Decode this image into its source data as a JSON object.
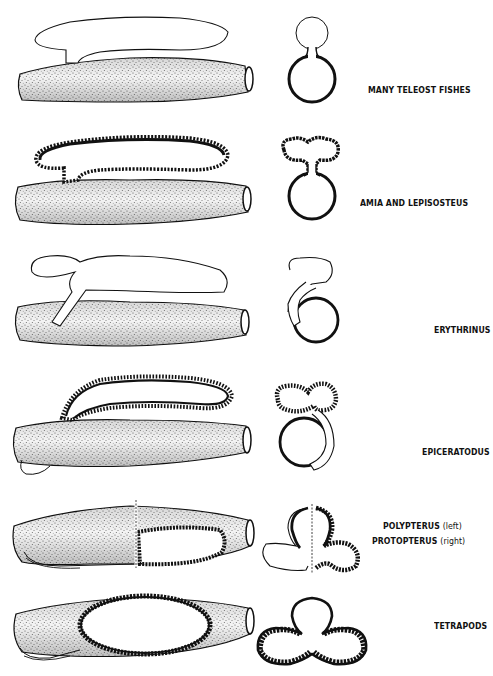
{
  "figure": {
    "rows": [
      {
        "label": "MANY TELEOST FISHES",
        "sublabel": ""
      },
      {
        "label": "AMIA AND LEPISOSTEUS",
        "sublabel": ""
      },
      {
        "label": "ERYTHRINUS",
        "sublabel": ""
      },
      {
        "label": "EPICERATODUS",
        "sublabel": ""
      },
      {
        "label": "POLYPTERUS",
        "sublabel": "(left)"
      },
      {
        "label": "PROTOPTERUS",
        "sublabel": "(right)"
      },
      {
        "label": "TETRAPODS",
        "sublabel": ""
      }
    ]
  },
  "colors": {
    "ink": "#111111",
    "stipple": "#9a9a9a",
    "background": "#ffffff"
  }
}
